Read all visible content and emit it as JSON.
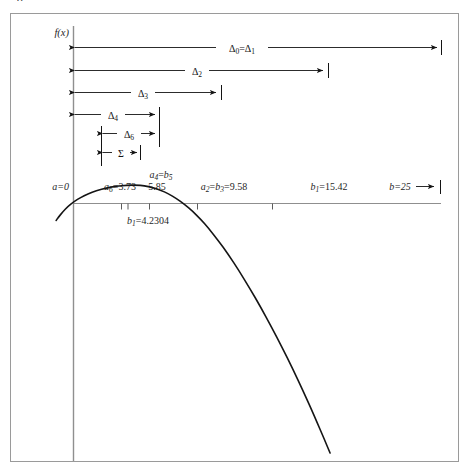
{
  "figure": {
    "label": "8",
    "axis_y_label": "f(x)",
    "frame_color": "#8a8a8a",
    "axis_color": "#7d7d7d",
    "curve_color": "#151515",
    "arrow_color": "#141414",
    "background": "#ffffff"
  },
  "axis_labels": [
    {
      "id": "a",
      "text": "a=0",
      "x_data": 0.0,
      "anchor": "end"
    },
    {
      "id": "a6",
      "text": "a₆=3.73",
      "x_data": 3.73,
      "anchor": "middle"
    },
    {
      "id": "a4b5",
      "text": "a₄=b₅",
      "x_data": 5.85,
      "anchor": "middle"
    },
    {
      "id": "a4b5val",
      "text": "5.85",
      "x_data": 5.85,
      "anchor": "middle"
    },
    {
      "id": "a2b3",
      "text": "a₂=b₃=9.58",
      "x_data": 9.58,
      "anchor": "middle"
    },
    {
      "id": "b1",
      "text": "b₁=15.42",
      "x_data": 15.42,
      "anchor": "middle"
    },
    {
      "id": "b",
      "text": "b=25",
      "x_data": 25.0,
      "anchor": "middle"
    }
  ],
  "below_axis_label": {
    "id": "b1low",
    "text": "b₁=4.2304",
    "x_data": 4.2304
  },
  "tick_values": [
    3.73,
    4.2304,
    5.85,
    9.58,
    15.42
  ],
  "intervals": [
    {
      "id": "d01",
      "label": "Δ₀=Δ₁",
      "from": 0.0,
      "to": 25.0,
      "row": 0
    },
    {
      "id": "d2",
      "label": "Δ₂",
      "from": 0.0,
      "to": 15.42,
      "row": 1
    },
    {
      "id": "d3",
      "label": "Δ₃",
      "from": 0.0,
      "to": 9.58,
      "row": 2
    },
    {
      "id": "d4",
      "label": "Δ₄",
      "from": 0.0,
      "to": 5.85,
      "row": 3
    },
    {
      "id": "d6",
      "label": "Δ₆",
      "from": 2.12,
      "to": 5.85,
      "row": 4
    },
    {
      "id": "sig",
      "label": "Σ",
      "from": 2.12,
      "to": 5.0,
      "row": 5
    }
  ],
  "chart_data": {
    "type": "line",
    "title": "",
    "xlabel": "",
    "ylabel": "f(x)",
    "xlim": [
      -1.4,
      27.5
    ],
    "ylim": [
      -19.5,
      2.6
    ],
    "grid": false,
    "legend": null,
    "annotations": [
      "a=0",
      "a₆=3.73",
      "a₄=b₅",
      "5.85",
      "a₂=b₃=9.58",
      "b₁=15.42",
      "b=25",
      "b₁=4.2304",
      "Δ₀=Δ₁",
      "Δ₂",
      "Δ₃",
      "Δ₄",
      "Δ₆",
      "Σ"
    ],
    "curve_points": [
      [
        -1.3,
        -1.28
      ],
      [
        -1.0,
        -0.88
      ],
      [
        -0.6,
        -0.42
      ],
      [
        -0.2,
        -0.05
      ],
      [
        0.3,
        0.31
      ],
      [
        0.8,
        0.59
      ],
      [
        1.4,
        0.86
      ],
      [
        2.1,
        1.08
      ],
      [
        2.8,
        1.24
      ],
      [
        3.6,
        1.35
      ],
      [
        4.4,
        1.39
      ],
      [
        5.0,
        1.37
      ],
      [
        5.6,
        1.28
      ],
      [
        6.2,
        1.12
      ],
      [
        6.8,
        0.88
      ],
      [
        7.4,
        0.56
      ],
      [
        8.0,
        0.16
      ],
      [
        8.6,
        -0.32
      ],
      [
        9.2,
        -0.88
      ],
      [
        9.8,
        -1.52
      ],
      [
        10.5,
        -2.38
      ],
      [
        11.2,
        -3.32
      ],
      [
        12.0,
        -4.5
      ],
      [
        12.8,
        -5.78
      ],
      [
        13.6,
        -7.14
      ],
      [
        14.4,
        -8.58
      ],
      [
        15.2,
        -10.1
      ],
      [
        16.0,
        -11.7
      ],
      [
        16.8,
        -13.38
      ],
      [
        17.6,
        -15.14
      ],
      [
        18.2,
        -16.52
      ],
      [
        18.8,
        -17.94
      ],
      [
        19.2,
        -18.9
      ]
    ]
  }
}
